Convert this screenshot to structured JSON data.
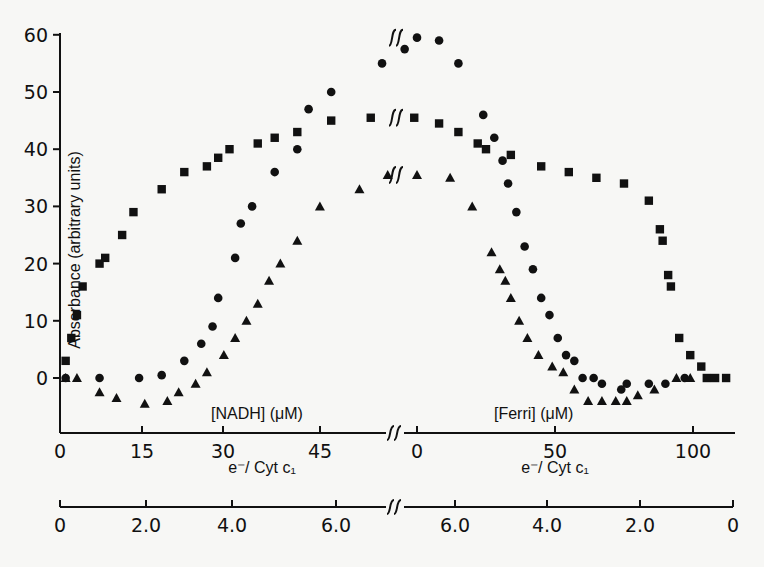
{
  "chart_data": {
    "type": "scatter",
    "title": "",
    "ylabel": "Absorbance (arbitrary units)",
    "ylim": [
      -10,
      60
    ],
    "yticks": [
      0,
      10,
      20,
      30,
      40,
      50,
      60
    ],
    "grid": false,
    "legend": null,
    "x_axes": {
      "left_primary": {
        "label": "[NADH] (μM)",
        "ticks": [
          0,
          15,
          30,
          45
        ],
        "range": [
          0,
          60
        ]
      },
      "right_primary": {
        "label": "[Ferri] (μM)",
        "ticks": [
          0,
          50,
          100
        ],
        "range": [
          0,
          115
        ],
        "direction": "increasing"
      },
      "left_secondary": {
        "label": "e⁻/ Cyt c₁",
        "ticks": [
          "0",
          "2.0",
          "4.0",
          "6.0"
        ]
      },
      "right_secondary": {
        "label": "e⁻/ Cyt c₁",
        "ticks": [
          "6.0",
          "4.0",
          "2.0",
          "0"
        ]
      },
      "break_marks": "∫∫"
    },
    "series": [
      {
        "name": "circles",
        "marker": "circle",
        "nadh": {
          "x": [
            1,
            7,
            14,
            18,
            22,
            25,
            27,
            28,
            31,
            32,
            34,
            38,
            42,
            44,
            48,
            57,
            61
          ],
          "y": [
            0,
            0,
            0,
            0.5,
            3,
            6,
            9,
            14,
            21,
            27,
            30,
            36,
            40,
            47,
            50,
            55,
            57.5
          ]
        },
        "ferri": {
          "x": [
            0,
            8,
            15,
            24,
            28,
            31,
            33,
            36,
            39,
            42,
            45,
            48,
            51,
            54,
            57,
            60,
            64,
            67,
            74,
            76,
            84,
            90,
            97
          ],
          "y": [
            59.5,
            59,
            55,
            46,
            42,
            38,
            34,
            29,
            23,
            19,
            14,
            11,
            7,
            4,
            3,
            0,
            0,
            -1,
            -2,
            -1,
            -1,
            -1,
            0
          ]
        }
      },
      {
        "name": "squares",
        "marker": "square",
        "nadh": {
          "x": [
            1,
            2,
            3,
            4,
            7,
            8,
            11,
            13,
            18,
            22,
            26,
            28,
            30,
            35,
            38,
            42,
            48,
            55
          ],
          "y": [
            3,
            7,
            11,
            16,
            20,
            21,
            25,
            29,
            33,
            36,
            37,
            38.5,
            40,
            41,
            42,
            43,
            45,
            45.5
          ]
        },
        "ferri": {
          "x": [
            -1,
            8,
            15,
            22,
            25,
            34,
            45,
            55,
            65,
            75,
            84,
            88,
            89,
            91,
            92,
            95,
            99,
            103,
            105,
            108,
            112
          ],
          "y": [
            45.5,
            44.5,
            43,
            41,
            40,
            39,
            37,
            36,
            35,
            34,
            31,
            26,
            24,
            18,
            16,
            7,
            4,
            2,
            0,
            0,
            0
          ]
        }
      },
      {
        "name": "triangles",
        "marker": "triangle",
        "nadh": {
          "x": [
            1,
            3,
            7,
            10,
            15,
            19,
            21,
            24,
            26,
            29,
            31,
            33,
            35,
            37,
            39,
            42,
            46,
            53,
            58
          ],
          "y": [
            0,
            0,
            -2.5,
            -3.5,
            -4.5,
            -4,
            -2.5,
            -1,
            1,
            4,
            7,
            10,
            13,
            17,
            20,
            24,
            30,
            33,
            35.5
          ]
        },
        "ferri": {
          "x": [
            0,
            12,
            20,
            27,
            30,
            32,
            34,
            37,
            40,
            44,
            49,
            53,
            57,
            62,
            67,
            72,
            76,
            80,
            86,
            94,
            99
          ],
          "y": [
            35.5,
            35,
            30,
            22,
            19,
            17,
            14,
            10,
            7,
            4,
            2,
            1,
            -2,
            -4,
            -4,
            -4,
            -4,
            -3,
            -2,
            0,
            0
          ]
        }
      }
    ]
  },
  "labels": {
    "y_title": "Absorbance (arbitrary units)",
    "nadh_label": "[NADH] (μM)",
    "ferri_label": "[Ferri] (μM)",
    "ratio_label_left": "e⁻/ Cyt c₁",
    "ratio_label_right": "e⁻/ Cyt c₁"
  }
}
